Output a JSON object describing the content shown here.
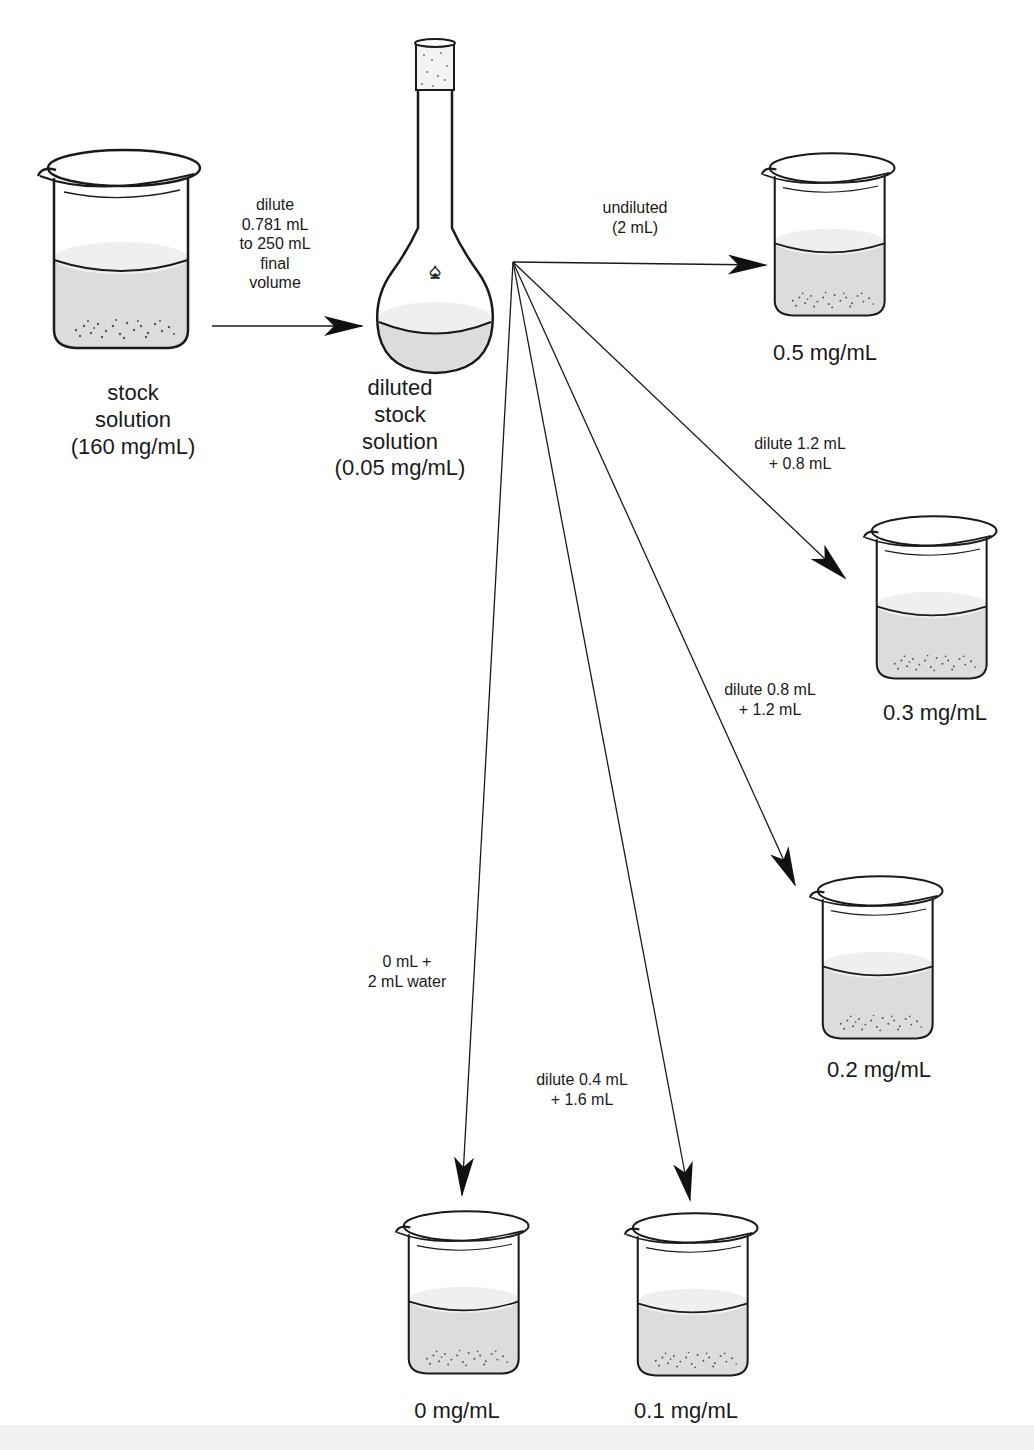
{
  "diagram": {
    "type": "serial dilution scheme",
    "stock": {
      "label": "stock\nsolution\n(160 mg/mL)",
      "concentration_mg_per_mL": 160
    },
    "stock_to_flask_step": {
      "label": "dilute\n0.781 mL\nto 250 mL\nfinal\nvolume",
      "aliquot_mL": 0.781,
      "final_volume_mL": 250
    },
    "diluted_stock": {
      "label": "diluted\nstock\nsolution\n(0.05 mg/mL)",
      "concentration_mg_per_mL": 0.05
    },
    "branches": [
      {
        "step": "undiluted\n(2 mL)",
        "result": "0.5 mg/mL"
      },
      {
        "step": "dilute 1.2 mL\n+ 0.8 mL",
        "result": "0.3 mg/mL"
      },
      {
        "step": "dilute 0.8 mL\n+ 1.2 mL",
        "result": "0.2 mg/mL"
      },
      {
        "step": "dilute 0.4 mL\n+ 1.6 mL",
        "result": "0.1 mg/mL"
      },
      {
        "step": "0 mL +\n2 mL water",
        "result": "0 mg/mL"
      }
    ],
    "icons": {
      "stock_container": "beaker-icon",
      "diluted_container": "volumetric-flask-icon",
      "result_container": "beaker-icon",
      "flask_mark": "spade-icon"
    },
    "colors": {
      "line": "#1a1a1a",
      "liquid": "#d9d9d9",
      "liquid_top": "#ececec",
      "background": "#ffffff"
    }
  }
}
